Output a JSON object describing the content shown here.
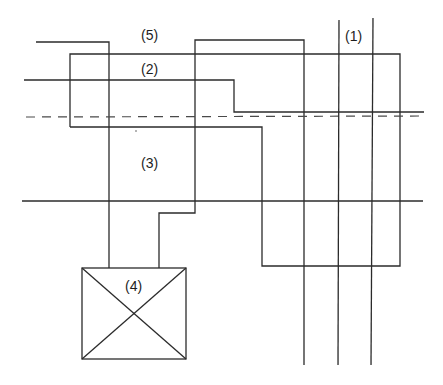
{
  "diagram": {
    "title": "",
    "labels": {
      "l1": "(1)",
      "l2": "(2)",
      "l3": "(3)",
      "l4": "(4)",
      "l5": "(5)"
    },
    "colors": {
      "line": "#2b2b2b",
      "dashed": "#4a4a4a",
      "background": "#ffffff"
    },
    "elements": [
      {
        "id": "1",
        "label": "(1)",
        "kind": "pair of vertical lines"
      },
      {
        "id": "2",
        "label": "(2)",
        "kind": "stepped horizontal line"
      },
      {
        "id": "3",
        "label": "(3)",
        "kind": "region between lines"
      },
      {
        "id": "4",
        "label": "(4)",
        "kind": "crossed box"
      },
      {
        "id": "5",
        "label": "(5)",
        "kind": "top line path"
      }
    ]
  }
}
